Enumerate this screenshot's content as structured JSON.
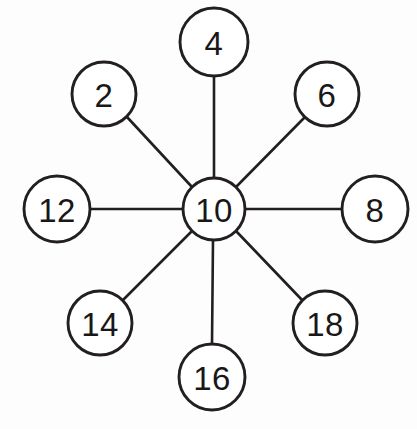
{
  "diagram": {
    "type": "radial-number-web",
    "canvas": {
      "width": 417,
      "height": 429,
      "background": "#fdfdfd"
    },
    "stroke_color": "#231f20",
    "fill_color": "#ffffff",
    "center_node": {
      "label": "10",
      "value": 10,
      "cx": 214,
      "cy": 209,
      "r": 31
    },
    "outer_nodes": [
      {
        "label": "4",
        "value": 4,
        "cx": 214,
        "cy": 42,
        "r": 34,
        "angle_deg": 90,
        "position": "top"
      },
      {
        "label": "6",
        "value": 6,
        "cx": 327,
        "cy": 94,
        "r": 32,
        "angle_deg": 45,
        "position": "top-right"
      },
      {
        "label": "8",
        "value": 8,
        "cx": 375,
        "cy": 209,
        "r": 33,
        "angle_deg": 0,
        "position": "right"
      },
      {
        "label": "18",
        "value": 18,
        "cx": 325,
        "cy": 323,
        "r": 32,
        "angle_deg": 315,
        "position": "bottom-right"
      },
      {
        "label": "16",
        "value": 16,
        "cx": 212,
        "cy": 377,
        "r": 33,
        "angle_deg": 270,
        "position": "bottom"
      },
      {
        "label": "14",
        "value": 14,
        "cx": 100,
        "cy": 323,
        "r": 32,
        "angle_deg": 225,
        "position": "bottom-left"
      },
      {
        "label": "12",
        "value": 12,
        "cx": 57,
        "cy": 209,
        "r": 33,
        "angle_deg": 180,
        "position": "left"
      },
      {
        "label": "2",
        "value": 2,
        "cx": 104,
        "cy": 94,
        "r": 32,
        "angle_deg": 135,
        "position": "top-left"
      }
    ],
    "spokes": [
      {
        "from": "10",
        "to": "4",
        "x1": 214,
        "y1": 178,
        "x2": 214,
        "y2": 76
      },
      {
        "from": "10",
        "to": "6",
        "x1": 236,
        "y1": 187,
        "x2": 305,
        "y2": 117
      },
      {
        "from": "10",
        "to": "8",
        "x1": 245,
        "y1": 209,
        "x2": 342,
        "y2": 209
      },
      {
        "from": "10",
        "to": "18",
        "x1": 236,
        "y1": 231,
        "x2": 303,
        "y2": 301
      },
      {
        "from": "10",
        "to": "16",
        "x1": 213,
        "y1": 240,
        "x2": 212,
        "y2": 344
      },
      {
        "from": "10",
        "to": "14",
        "x1": 192,
        "y1": 231,
        "x2": 123,
        "y2": 300
      },
      {
        "from": "10",
        "to": "12",
        "x1": 183,
        "y1": 209,
        "x2": 90,
        "y2": 209
      },
      {
        "from": "10",
        "to": "2",
        "x1": 192,
        "y1": 187,
        "x2": 127,
        "y2": 117
      }
    ]
  }
}
